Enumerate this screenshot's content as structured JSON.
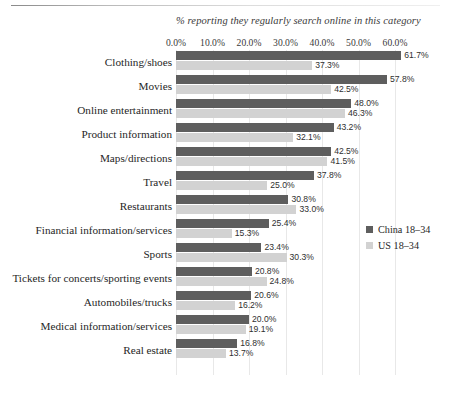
{
  "chart_data": {
    "type": "bar",
    "orientation": "horizontal",
    "title": "% reporting they regularly search online in this category",
    "xlabel": "",
    "ylabel": "",
    "xlim": [
      0,
      60
    ],
    "grid": true,
    "legend_position": "right",
    "tick_labels": [
      "0.0%",
      "10.0%",
      "20.0%",
      "30.0%",
      "40.0%",
      "50.0%",
      "60.0%"
    ],
    "tick_values": [
      0,
      10,
      20,
      30,
      40,
      50,
      60
    ],
    "categories": [
      "Clothing/shoes",
      "Movies",
      "Online entertainment",
      "Product information",
      "Maps/directions",
      "Travel",
      "Restaurants",
      "Financial information/services",
      "Sports",
      "Tickets for concerts/sporting events",
      "Automobiles/trucks",
      "Medical information/services",
      "Real estate"
    ],
    "series": [
      {
        "name": "China 18–34",
        "color": "#5e5e5e",
        "values": [
          61.7,
          57.8,
          48.0,
          43.2,
          42.5,
          37.8,
          30.8,
          25.4,
          23.4,
          20.8,
          20.6,
          20.0,
          16.8
        ],
        "labels": [
          "61.7%",
          "57.8%",
          "48.0%",
          "43.2%",
          "42.5%",
          "37.8%",
          "30.8%",
          "25.4%",
          "23.4%",
          "20.8%",
          "20.6%",
          "20.0%",
          "16.8%"
        ]
      },
      {
        "name": "US 18–34",
        "color": "#d2d2d2",
        "values": [
          37.3,
          42.5,
          46.3,
          32.1,
          41.5,
          25.0,
          33.0,
          15.3,
          30.3,
          24.8,
          16.2,
          19.1,
          13.7
        ],
        "labels": [
          "37.3%",
          "42.5%",
          "46.3%",
          "32.1%",
          "41.5%",
          "25.0%",
          "33.0%",
          "15.3%",
          "30.3%",
          "24.8%",
          "16.2%",
          "19.1%",
          "13.7%"
        ]
      }
    ]
  },
  "legend": {
    "items": [
      {
        "label": "China 18–34",
        "color": "#5e5e5e"
      },
      {
        "label": "US 18–34",
        "color": "#d2d2d2"
      }
    ]
  }
}
